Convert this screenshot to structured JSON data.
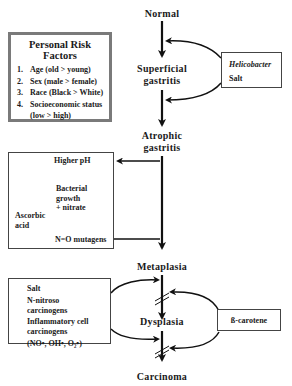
{
  "diagram": {
    "stages": [
      {
        "id": "normal",
        "label": "Normal"
      },
      {
        "id": "superficial",
        "label_line1": "Superficial",
        "label_line2": "gastritis"
      },
      {
        "id": "atrophic",
        "label_line1": "Atrophic",
        "label_line2": "gastritis"
      },
      {
        "id": "metaplasia",
        "label": "Metaplasia"
      },
      {
        "id": "dysplasia",
        "label": "Dysplasia"
      },
      {
        "id": "carcinoma",
        "label": "Carcinoma"
      }
    ],
    "risk_factors": {
      "title": "Personal Risk Factors",
      "items": [
        {
          "num": "1.",
          "text": "Age (old > young)"
        },
        {
          "num": "2.",
          "text": "Sex (male > female)"
        },
        {
          "num": "3.",
          "text": "Race (Black > White)"
        },
        {
          "num": "4.",
          "text": "Socioeconomic status",
          "text2": "(low > high)"
        }
      ]
    },
    "helicobacter_box": {
      "line1": "Helicobacter",
      "line2": "Salt"
    },
    "mutagen_box": {
      "higher_ph": "Higher pH",
      "bacterial_1": "Bacterial",
      "bacterial_2": "growth",
      "bacterial_3": "+ nitrate",
      "ascorbic_1": "Ascorbic",
      "ascorbic_2": "acid",
      "mutagens": "N=O mutagens"
    },
    "carcinogen_box": {
      "salt": "Salt",
      "nitroso_1": "N-nitroso",
      "nitroso_2": "carcinogens",
      "inflam_1": "Inflammatory cell",
      "inflam_2": "carcinogens",
      "radicals": "(NO•, OH•, O₂•)"
    },
    "carotene_box": {
      "label": "ß-carotene"
    }
  }
}
